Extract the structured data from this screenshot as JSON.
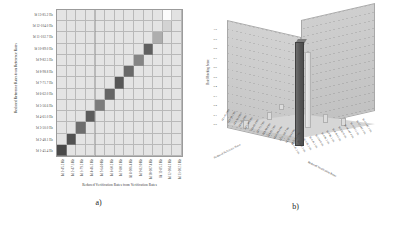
{
  "figure": {
    "panel_a": {
      "caption": "a)",
      "xlabel": "Reduced Verification Rates from Verification Rates",
      "ylabel": "Reduced Reference Rates from Reference Rates",
      "y_ticks": [
        "Id 1-45.4 Hz",
        "Id 2-48.1 Hz",
        "Id 3-50.0 Hz",
        "Id 4-61.0 Hz",
        "Id 5-56.6 Hz",
        "Id 6-62.0 Hz",
        "Id 7-71.7 Hz",
        "Id 8-98.8 Hz",
        "Id 9-82.5 Hz",
        "Id 10-89.0 Hz",
        "Id 11-102.7 Hz",
        "Id 12-104.0 Hz",
        "Id 13-85.2 Hz"
      ],
      "x_ticks": [
        "Id 1-45.2 Hz",
        "Id 2-47.3 Hz",
        "Id 3-79.2 Hz",
        "Id 4-46.1 Hz",
        "Id 5-64.0 Hz",
        "Id 6-60.2 Hz",
        "Id 7-80.1 Hz",
        "Id 8-106.4 Hz",
        "Id 9-82.0 Hz",
        "Id 10-107.4 Hz",
        "Id 11-85.1 Hz",
        "Id 12-104.1 Hz",
        "Id 13-102.1 Hz"
      ]
    },
    "panel_b": {
      "caption": "b)",
      "zlabel": "Rate Matching Score",
      "xlabel": "Reduced Reference Rates",
      "ylabel": "Reduced Verification Rates",
      "z_ticks": [
        "1.0",
        "0.9",
        "0.8",
        "0.7",
        "0.6",
        "0.5",
        "0.4",
        "0.3",
        "0.2",
        "0.1",
        "0.0"
      ],
      "base_ticks_left": [
        "Id 1-45.4 Hz",
        "Id 2-48.1 Hz",
        "Id 3-50.0 Hz",
        "Id 4-61.0 Hz",
        "Id 5-56.6 Hz",
        "Id 6-62.0 Hz",
        "Id 7-71.7 Hz",
        "Id 8-98.8 Hz",
        "Id 9-82.5 Hz",
        "Id 10-89.0 Hz",
        "Id 11-102.7 Hz",
        "Id 12-104.0 Hz",
        "Id 13-85.2 Hz"
      ],
      "base_ticks_right": [
        "Id 1-45.2 Hz",
        "Id 2-47.3 Hz",
        "Id 3-79.2 Hz",
        "Id 4-46.1 Hz",
        "Id 5-64.0 Hz",
        "Id 6-60.2 Hz",
        "Id 7-80.1 Hz",
        "Id 8-106.4 Hz",
        "Id 9-82.0 Hz",
        "Id 10-107.4 Hz",
        "Id 11-85.1 Hz",
        "Id 12-104.1 Hz",
        "Id 13-102.1 Hz"
      ]
    }
  },
  "chart_data": [
    {
      "type": "heatmap",
      "title": "",
      "xlabel": "Reduced Verification Rates from Verification Rates",
      "ylabel": "Reduced Reference Rates from Reference Rates",
      "colormap": "grayscale",
      "background_value": 0.12,
      "note": "Strong bright/dark diagonal indicating one-to-one rate matching; background near-uniform light gray; a near-white cell appears in the upper-right region.",
      "categories_x": [
        "Id 1-45.2 Hz",
        "Id 2-47.3 Hz",
        "Id 3-79.2 Hz",
        "Id 4-46.1 Hz",
        "Id 5-64.0 Hz",
        "Id 6-60.2 Hz",
        "Id 7-80.1 Hz",
        "Id 8-106.4 Hz",
        "Id 9-82.0 Hz",
        "Id 10-107.4 Hz",
        "Id 11-85.1 Hz",
        "Id 12-104.1 Hz",
        "Id 13-102.1 Hz"
      ],
      "categories_y": [
        "Id 1-45.4 Hz",
        "Id 2-48.1 Hz",
        "Id 3-50.0 Hz",
        "Id 4-61.0 Hz",
        "Id 5-56.6 Hz",
        "Id 6-62.0 Hz",
        "Id 7-71.7 Hz",
        "Id 8-98.8 Hz",
        "Id 9-82.5 Hz",
        "Id 10-89.0 Hz",
        "Id 11-102.7 Hz",
        "Id 12-104.0 Hz",
        "Id 13-85.2 Hz"
      ],
      "values": [
        [
          0.82,
          0.12,
          0.1,
          0.11,
          0.1,
          0.11,
          0.1,
          0.1,
          0.11,
          0.1,
          0.12,
          0.11,
          0.1
        ],
        [
          0.12,
          0.78,
          0.11,
          0.1,
          0.11,
          0.1,
          0.11,
          0.1,
          0.1,
          0.11,
          0.1,
          0.12,
          0.11
        ],
        [
          0.1,
          0.11,
          0.66,
          0.12,
          0.1,
          0.11,
          0.1,
          0.11,
          0.1,
          0.1,
          0.11,
          0.1,
          0.12
        ],
        [
          0.11,
          0.1,
          0.12,
          0.74,
          0.11,
          0.1,
          0.11,
          0.1,
          0.12,
          0.11,
          0.1,
          0.11,
          0.1
        ],
        [
          0.1,
          0.11,
          0.1,
          0.11,
          0.6,
          0.12,
          0.1,
          0.11,
          0.1,
          0.12,
          0.11,
          0.1,
          0.11
        ],
        [
          0.11,
          0.1,
          0.11,
          0.1,
          0.12,
          0.7,
          0.11,
          0.1,
          0.11,
          0.1,
          0.12,
          0.11,
          0.1
        ],
        [
          0.1,
          0.11,
          0.1,
          0.12,
          0.1,
          0.11,
          0.76,
          0.12,
          0.1,
          0.11,
          0.1,
          0.11,
          0.12
        ],
        [
          0.11,
          0.1,
          0.12,
          0.1,
          0.11,
          0.1,
          0.12,
          0.68,
          0.11,
          0.1,
          0.11,
          0.12,
          0.1
        ],
        [
          0.1,
          0.12,
          0.1,
          0.11,
          0.1,
          0.12,
          0.1,
          0.11,
          0.56,
          0.12,
          0.1,
          0.11,
          0.1
        ],
        [
          0.12,
          0.1,
          0.11,
          0.1,
          0.12,
          0.1,
          0.11,
          0.1,
          0.12,
          0.72,
          0.11,
          0.1,
          0.12
        ],
        [
          0.1,
          0.11,
          0.1,
          0.12,
          0.1,
          0.11,
          0.1,
          0.12,
          0.1,
          0.11,
          0.38,
          0.12,
          0.1
        ],
        [
          0.11,
          0.1,
          0.12,
          0.1,
          0.11,
          0.12,
          0.1,
          0.11,
          0.1,
          0.12,
          0.11,
          0.22,
          0.14
        ],
        [
          0.1,
          0.12,
          0.1,
          0.11,
          0.12,
          0.1,
          0.11,
          0.1,
          0.12,
          0.1,
          0.11,
          0.02,
          0.16
        ]
      ]
    },
    {
      "type": "bar",
      "title": "",
      "projection": "3d",
      "xlabel": "Reduced Reference Rates",
      "ylabel": "Reduced Verification Rates",
      "zlabel": "Rate Matching Score",
      "zlim": [
        0,
        1.0
      ],
      "z_ticks": [
        0.0,
        0.1,
        0.2,
        0.3,
        0.4,
        0.5,
        0.6,
        0.7,
        0.8,
        0.9,
        1.0
      ],
      "note": "One dominant tall dark bar reaching near the top of the score axis, a second lighter tall bar beside it, and a few small low bars scattered across the base grid.",
      "bars": [
        {
          "x": "Id 7-80.1 Hz",
          "y": "Id 7-71.7 Hz",
          "value": 0.97
        },
        {
          "x": "Id 8-106.4 Hz",
          "y": "Id 8-98.8 Hz",
          "value": 0.72
        },
        {
          "x": "Id 3-79.2 Hz",
          "y": "Id 3-50.0 Hz",
          "value": 0.14
        },
        {
          "x": "Id 5-64.0 Hz",
          "y": "Id 5-56.6 Hz",
          "value": 0.11
        },
        {
          "x": "Id 10-107.4 Hz",
          "y": "Id 10-89.0 Hz",
          "value": 0.09
        },
        {
          "x": "Id 12-104.1 Hz",
          "y": "Id 12-104.0 Hz",
          "value": 0.07
        },
        {
          "x": "Id 1-45.2 Hz",
          "y": "Id 1-45.4 Hz",
          "value": 0.06
        }
      ]
    }
  ]
}
